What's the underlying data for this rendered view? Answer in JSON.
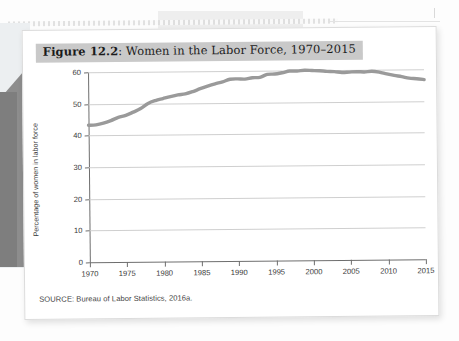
{
  "figure": {
    "title_prefix": "Figure 12.2",
    "title_rest": ": Women in the Labor Force, 1970–2015",
    "source": "SOURCE: Bureau of Labor Statistics, 2016a.",
    "title_band_color": "#c9c9c9",
    "line_color": "#9a9a9a",
    "grid_color": "#cfcfcf",
    "axis_color": "#6e6e6e",
    "card_color": "#ffffff"
  },
  "chart_data": {
    "type": "line",
    "title": "Figure 12.2: Women in the Labor Force, 1970–2015",
    "xlabel": "",
    "ylabel": "Percentage of women in labor force",
    "xlim": [
      1970,
      2015
    ],
    "ylim": [
      0,
      60
    ],
    "grid": true,
    "legend": "none",
    "ytick_labels": [
      "0",
      "10",
      "20",
      "30",
      "40",
      "50",
      "60"
    ],
    "yticks": [
      0,
      10,
      20,
      30,
      40,
      50,
      60
    ],
    "xtick_labels": [
      "1970",
      "1975",
      "1980",
      "1985",
      "1990",
      "1995",
      "2000",
      "2005",
      "2010",
      "2015"
    ],
    "xticks": [
      1970,
      1975,
      1980,
      1985,
      1990,
      1995,
      2000,
      2005,
      2010,
      2015
    ],
    "series": [
      {
        "name": "Percentage of women in labor force",
        "x": [
          1970,
          1971,
          1972,
          1973,
          1974,
          1975,
          1976,
          1977,
          1978,
          1979,
          1980,
          1981,
          1982,
          1983,
          1984,
          1985,
          1986,
          1987,
          1988,
          1989,
          1990,
          1991,
          1992,
          1993,
          1994,
          1995,
          1996,
          1997,
          1998,
          1999,
          2000,
          2001,
          2002,
          2003,
          2004,
          2005,
          2006,
          2007,
          2008,
          2009,
          2010,
          2011,
          2012,
          2013,
          2014,
          2015
        ],
        "values": [
          43.3,
          43.4,
          43.9,
          44.7,
          45.7,
          46.3,
          47.3,
          48.4,
          50.0,
          50.9,
          51.5,
          52.1,
          52.6,
          52.9,
          53.6,
          54.5,
          55.3,
          56.0,
          56.6,
          57.4,
          57.5,
          57.4,
          57.8,
          57.9,
          58.8,
          58.9,
          59.3,
          59.8,
          59.8,
          60.0,
          59.9,
          59.8,
          59.6,
          59.5,
          59.2,
          59.3,
          59.4,
          59.3,
          59.5,
          59.2,
          58.6,
          58.1,
          57.7,
          57.2,
          57.0,
          56.7
        ]
      }
    ]
  }
}
